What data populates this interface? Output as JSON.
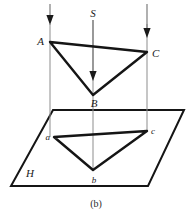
{
  "figure": {
    "caption": "(b)",
    "labels": {
      "source": "S",
      "plane": "H",
      "A": "A",
      "B": "B",
      "C": "C",
      "a": "a",
      "b": "b",
      "c": "c"
    },
    "colors": {
      "ink": "#151515",
      "triangle_fill": "#e0e0e0",
      "projection_line": "#8d8d8d",
      "background": "#ffffff"
    }
  },
  "geometry": {
    "triangle_upper": {
      "name": "ABC",
      "points": "50,42 147,52 93,95",
      "vertices": [
        {
          "id": "A",
          "x": 50,
          "y": 42
        },
        {
          "id": "C",
          "x": 147,
          "y": 52
        },
        {
          "id": "B",
          "x": 93,
          "y": 95
        }
      ]
    },
    "triangle_lower": {
      "name": "abc",
      "points": "54,137 147,131 93,170",
      "vertices": [
        {
          "id": "a",
          "x": 54,
          "y": 137
        },
        {
          "id": "c",
          "x": 147,
          "y": 131
        },
        {
          "id": "b",
          "x": 93,
          "y": 170
        }
      ]
    },
    "plane": {
      "name": "H",
      "points": "53,110 184,110 148,186 11,186"
    },
    "rays": [
      {
        "id": "ray-left",
        "x": 50,
        "y_start": 4,
        "y_arrow_tip": 24,
        "y_end": 137
      },
      {
        "id": "ray-middle",
        "x": 93,
        "y_start": 20,
        "y_arrow_tip": 80,
        "y_end": 170
      },
      {
        "id": "ray-right",
        "x": 147,
        "y_start": 4,
        "y_arrow_tip": 37,
        "y_end": 131
      }
    ]
  }
}
